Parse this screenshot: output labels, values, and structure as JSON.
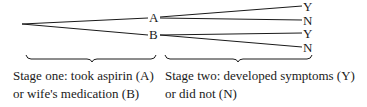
{
  "diagram": {
    "type": "tree",
    "stage_one": {
      "nodes": [
        {
          "id": "A",
          "label": "A"
        },
        {
          "id": "B",
          "label": "B"
        }
      ],
      "caption_line1": "Stage one: took aspirin (A)",
      "caption_line2": "or wife's medication (B)"
    },
    "stage_two": {
      "leaves": [
        {
          "parent": "A",
          "label": "Y"
        },
        {
          "parent": "A",
          "label": "N"
        },
        {
          "parent": "B",
          "label": "Y"
        },
        {
          "parent": "B",
          "label": "N"
        }
      ],
      "caption_line1": "Stage two: developed symptoms (Y)",
      "caption_line2": "or did not (N)"
    },
    "colors": {
      "line": "#1a1a1a",
      "background": "#ffffff"
    }
  }
}
